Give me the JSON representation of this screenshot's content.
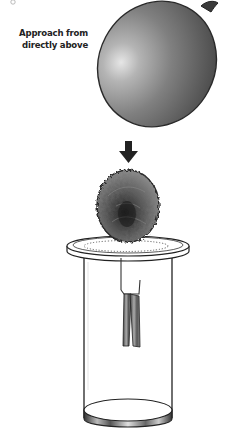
{
  "figure": {
    "caption_lines": [
      "Approach from",
      "directly above"
    ],
    "objects": {
      "balloon": "charged balloon",
      "arrow": "downward arrow",
      "electroscope": {
        "ball": "foil ball",
        "lid": "lid",
        "jar": "glass jar",
        "hook": "wire hook",
        "leaves": "foil leaves"
      }
    },
    "colors": {
      "balloon_dark": "#3a3a3a",
      "balloon_mid": "#7a7a7a",
      "balloon_light": "#d8d8d8",
      "outline": "#222222",
      "foil": "#555555",
      "background": "#ffffff"
    }
  }
}
